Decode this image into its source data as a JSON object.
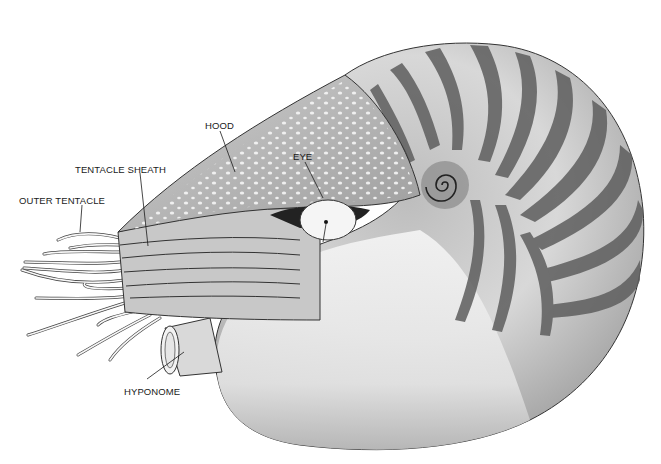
{
  "figure": {
    "colors": {
      "ink": "#1a1a1a",
      "shell_dark": "#555555",
      "shell_light": "#f2f2f2",
      "background": "#ffffff"
    }
  },
  "labels": [
    {
      "id": "eye",
      "text": "EYE",
      "x": 293,
      "y": 152
    },
    {
      "id": "hood",
      "text": "HOOD",
      "x": 205,
      "y": 121
    },
    {
      "id": "tentacle_sheath",
      "text": "TENTACLE SHEATH",
      "x": 75,
      "y": 165
    },
    {
      "id": "outer_tentacle",
      "text": "OUTER TENTACLE",
      "x": 19,
      "y": 196
    },
    {
      "id": "hyponome",
      "text": "HYPONOME",
      "x": 124,
      "y": 387
    }
  ]
}
